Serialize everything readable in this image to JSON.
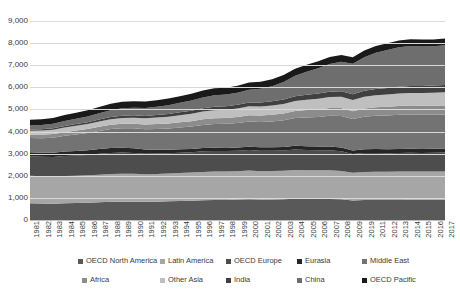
{
  "chart_data": {
    "type": "area",
    "stacked": true,
    "title": "",
    "subtitle": "",
    "xlabel": "",
    "ylabel": "",
    "grid": true,
    "legend_position": "bottom",
    "ylim": [
      0,
      9000
    ],
    "ytick_labels": [
      "0",
      "1,000",
      "2,000",
      "3,000",
      "4,000",
      "5,000",
      "6,000",
      "7,000",
      "8,000",
      "9,000"
    ],
    "ytick_values": [
      0,
      1000,
      2000,
      3000,
      4000,
      5000,
      6000,
      7000,
      8000,
      9000
    ],
    "categories": [
      "1981",
      "1982",
      "1983",
      "1984",
      "1985",
      "1986",
      "1987",
      "1988",
      "1989",
      "1990",
      "1991",
      "1992",
      "1993",
      "1994",
      "1995",
      "1996",
      "1997",
      "1998",
      "1999",
      "2000",
      "2001",
      "2002",
      "2003",
      "2004",
      "2005",
      "2006",
      "2007",
      "2008",
      "2009",
      "2019",
      "2011",
      "2012",
      "2013",
      "2014",
      "2015",
      "2016",
      "2017"
    ],
    "series": [
      {
        "name": "OECD North America",
        "color": "#595959",
        "values": [
          760,
          745,
          740,
          760,
          770,
          780,
          800,
          820,
          830,
          830,
          820,
          830,
          845,
          860,
          875,
          895,
          905,
          910,
          925,
          940,
          925,
          930,
          940,
          960,
          955,
          950,
          955,
          935,
          885,
          905,
          910,
          905,
          910,
          915,
          915,
          915,
          920
        ]
      },
      {
        "name": "Latin America",
        "color": "#a6a6a6",
        "values": [
          1240,
          1235,
          1230,
          1235,
          1235,
          1240,
          1250,
          1260,
          1265,
          1260,
          1245,
          1250,
          1255,
          1265,
          1270,
          1280,
          1285,
          1280,
          1285,
          1295,
          1285,
          1285,
          1290,
          1305,
          1300,
          1295,
          1295,
          1285,
          1255,
          1270,
          1275,
          1275,
          1280,
          1280,
          1275,
          1275,
          1275
        ]
      },
      {
        "name": "OECD Europe",
        "color": "#4d4d4d",
        "values": [
          880,
          875,
          880,
          900,
          915,
          925,
          945,
          955,
          955,
          945,
          930,
          925,
          915,
          915,
          920,
          930,
          930,
          925,
          925,
          930,
          920,
          915,
          915,
          920,
          915,
          905,
          900,
          885,
          840,
          855,
          850,
          840,
          840,
          845,
          845,
          850,
          855
        ]
      },
      {
        "name": "Eurasia",
        "color": "#262626",
        "values": [
          185,
          190,
          195,
          200,
          205,
          210,
          215,
          220,
          215,
          205,
          190,
          175,
          165,
          155,
          150,
          148,
          146,
          145,
          147,
          152,
          155,
          158,
          162,
          168,
          170,
          173,
          176,
          176,
          165,
          172,
          176,
          178,
          180,
          182,
          180,
          180,
          182
        ]
      },
      {
        "name": "Middle East",
        "color": "#737373",
        "values": [
          640,
          655,
          680,
          710,
          745,
          775,
          815,
          855,
          885,
          905,
          915,
          935,
          955,
          985,
          1010,
          1045,
          1075,
          1090,
          1105,
          1140,
          1150,
          1170,
          1200,
          1255,
          1300,
          1340,
          1385,
          1425,
          1420,
          1470,
          1505,
          1530,
          1545,
          1550,
          1545,
          1540,
          1540
        ]
      },
      {
        "name": "Africa",
        "color": "#8c8c8c",
        "values": [
          150,
          155,
          160,
          168,
          175,
          182,
          190,
          198,
          205,
          210,
          215,
          222,
          228,
          236,
          244,
          253,
          262,
          268,
          275,
          285,
          292,
          300,
          310,
          322,
          332,
          342,
          352,
          360,
          358,
          372,
          382,
          390,
          396,
          402,
          404,
          408,
          412
        ]
      },
      {
        "name": "Other Asia",
        "color": "#bfbfbf",
        "values": [
          180,
          188,
          196,
          206,
          216,
          226,
          238,
          250,
          262,
          272,
          282,
          294,
          308,
          322,
          336,
          352,
          366,
          372,
          382,
          398,
          408,
          420,
          434,
          452,
          468,
          482,
          496,
          508,
          508,
          528,
          544,
          556,
          566,
          574,
          578,
          584,
          590
        ]
      },
      {
        "name": "India",
        "color": "#404040",
        "values": [
          60,
          64,
          68,
          73,
          78,
          83,
          89,
          95,
          101,
          106,
          111,
          117,
          124,
          131,
          138,
          146,
          154,
          160,
          167,
          176,
          183,
          190,
          199,
          210,
          220,
          230,
          241,
          251,
          257,
          272,
          284,
          294,
          304,
          313,
          320,
          328,
          336
        ]
      },
      {
        "name": "China",
        "color": "#6e6e6e",
        "values": [
          180,
          190,
          205,
          225,
          245,
          265,
          290,
          315,
          335,
          345,
          355,
          375,
          400,
          430,
          460,
          495,
          520,
          525,
          545,
          580,
          620,
          680,
          790,
          930,
          1040,
          1150,
          1260,
          1330,
          1380,
          1520,
          1640,
          1720,
          1790,
          1810,
          1790,
          1775,
          1790
        ]
      },
      {
        "name": "OECD Pacific",
        "color": "#1a1a1a",
        "values": [
          260,
          262,
          264,
          268,
          272,
          276,
          282,
          288,
          292,
          294,
          292,
          294,
          296,
          300,
          304,
          308,
          312,
          310,
          312,
          318,
          314,
          314,
          316,
          320,
          318,
          316,
          316,
          312,
          296,
          304,
          306,
          304,
          304,
          306,
          306,
          306,
          308
        ]
      }
    ]
  }
}
